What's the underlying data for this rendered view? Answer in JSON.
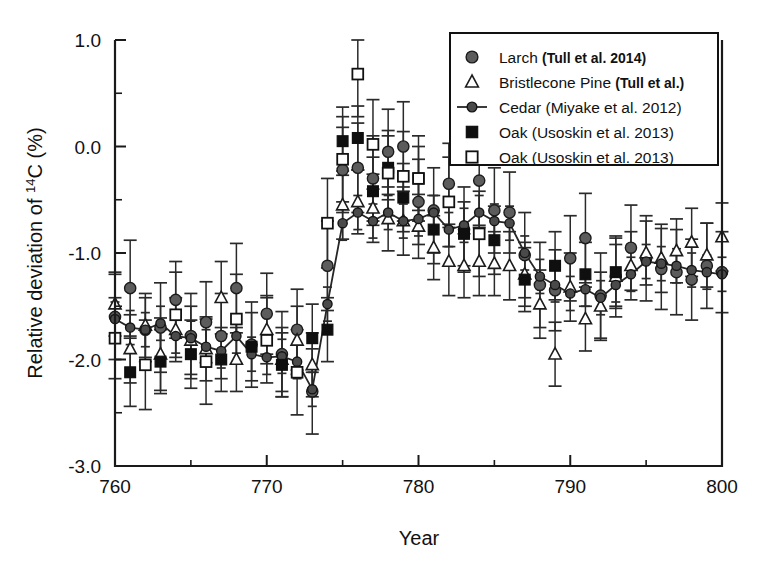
{
  "figure": {
    "name": "radiocarbon-relative-deviation-chart"
  },
  "axes": {
    "x_title": "Year",
    "y_title_prefix": "Relative deviation of ",
    "y_title_sup": "14",
    "y_title_suffix": "C (%)",
    "y_title_full": "Relative deviation of 14C (%)",
    "x_ticklabels": [
      "760",
      "770",
      "780",
      "790",
      "800"
    ],
    "y_ticklabels": [
      "1.0",
      "0.0",
      "-1.0",
      "-2.0",
      "-3.0"
    ]
  },
  "legend": {
    "entries": [
      {
        "marker": "filled-gray-circle",
        "name": "Larch",
        "ref": "(Tull et al. 2014)"
      },
      {
        "marker": "open-triangle",
        "name": "Bristlecone Pine",
        "ref": "(Tull et al.)"
      },
      {
        "marker": "line-with-circle",
        "name": "Cedar",
        "ref": "(Miyake et al. 2012)"
      },
      {
        "marker": "filled-black-square",
        "name": "Oak",
        "ref": "(Usoskin et al. 2013)"
      },
      {
        "marker": "open-square",
        "name": "Oak",
        "ref": "(Usoskin et al. 2013)"
      }
    ]
  },
  "chart_data": {
    "type": "scatter",
    "title": "",
    "xlabel": "Year",
    "ylabel": "Relative deviation of 14C (%)",
    "xlim": [
      760,
      800
    ],
    "ylim": [
      -3.0,
      1.0
    ],
    "xticks": [
      760,
      770,
      780,
      790,
      800
    ],
    "yticks": [
      1.0,
      0.0,
      -1.0,
      -2.0,
      -3.0
    ],
    "x_minor_ticks": [
      765,
      775,
      785,
      795
    ],
    "y_minor_ticks": [
      0.5,
      -0.5,
      -1.5,
      -2.5
    ],
    "grid": false,
    "legend_position": "top-right",
    "error_bars": "yerr",
    "series": [
      {
        "name": "Larch (Tull et al. 2014)",
        "marker": "filled-gray-circle",
        "color": "#5c5c5c",
        "x": [
          760,
          761,
          762,
          763,
          764,
          765,
          766,
          767,
          768,
          769,
          770,
          771,
          772,
          773,
          774,
          775,
          776,
          777,
          778,
          779,
          780,
          781,
          782,
          783,
          784,
          785,
          786,
          787,
          788,
          789,
          790,
          791,
          792,
          793,
          794,
          795,
          796,
          797,
          798,
          799,
          800
        ],
        "y": [
          -1.6,
          -1.33,
          -1.72,
          -1.7,
          -1.44,
          -1.78,
          -1.65,
          -1.78,
          -1.33,
          -1.86,
          -1.57,
          -1.95,
          -1.72,
          -2.3,
          -1.12,
          -0.22,
          -0.2,
          -0.3,
          -0.05,
          0.0,
          -0.52,
          -0.6,
          -0.35,
          -0.78,
          -0.32,
          -0.6,
          -0.62,
          -1.02,
          -1.3,
          -1.35,
          -1.05,
          -0.86,
          -1.4,
          -1.22,
          -0.95,
          -1.05,
          -1.15,
          -1.18,
          -1.25,
          -1.12,
          -1.18
        ],
        "yerr": [
          0.4,
          0.45,
          0.3,
          0.42,
          0.36,
          0.4,
          0.38,
          0.4,
          0.42,
          0.4,
          0.38,
          0.4,
          0.38,
          0.4,
          0.42,
          0.4,
          0.42,
          0.4,
          0.4,
          0.42,
          0.4,
          0.4,
          0.38,
          0.4,
          0.42,
          0.4,
          0.38,
          0.4,
          0.4,
          0.38,
          0.4,
          0.42,
          0.4,
          0.38,
          0.4,
          0.4,
          0.38,
          0.4,
          0.38,
          0.4,
          0.38
        ]
      },
      {
        "name": "Bristlecone Pine (Tull et al.)",
        "marker": "open-triangle",
        "color": "#ffffff",
        "x": [
          760,
          761,
          762,
          763,
          764,
          765,
          766,
          767,
          768,
          770,
          771,
          772,
          773,
          775,
          776,
          777,
          778,
          779,
          780,
          781,
          782,
          783,
          784,
          785,
          786,
          787,
          788,
          789,
          790,
          791,
          792,
          793,
          794,
          795,
          796,
          797,
          798,
          799,
          800
        ],
        "y": [
          -1.48,
          -1.9,
          -1.68,
          -1.95,
          -1.72,
          -1.82,
          -1.9,
          -1.42,
          -2.0,
          -1.72,
          -2.0,
          -1.82,
          -2.05,
          -0.55,
          -0.52,
          -0.58,
          -0.68,
          -0.7,
          -0.75,
          -0.95,
          -1.08,
          -1.12,
          -1.08,
          -1.1,
          -1.12,
          -1.2,
          -1.48,
          -1.95,
          -1.32,
          -1.62,
          -1.5,
          -1.22,
          -1.12,
          -1.0,
          -1.05,
          -0.98,
          -0.9,
          -1.02,
          -0.85
        ],
        "yerr": [
          0.3,
          0.32,
          0.3,
          0.34,
          0.3,
          0.32,
          0.3,
          0.34,
          0.3,
          0.32,
          0.3,
          0.32,
          0.3,
          0.32,
          0.3,
          0.32,
          0.3,
          0.32,
          0.3,
          0.3,
          0.32,
          0.3,
          0.32,
          0.3,
          0.32,
          0.3,
          0.32,
          0.3,
          0.32,
          0.3,
          0.32,
          0.3,
          0.32,
          0.3,
          0.32,
          0.3,
          0.32,
          0.3,
          0.32
        ]
      },
      {
        "name": "Cedar (Miyake et al. 2012)",
        "marker": "line-with-circle",
        "color": "#4a4a4a",
        "line": true,
        "x": [
          760,
          761,
          762,
          763,
          764,
          765,
          766,
          767,
          768,
          769,
          770,
          771,
          772,
          773,
          774,
          775,
          776,
          777,
          778,
          779,
          780,
          781,
          782,
          783,
          784,
          785,
          786,
          787,
          788,
          789,
          790,
          791,
          792,
          793,
          794,
          795,
          796,
          797,
          798,
          799,
          800
        ],
        "y": [
          -1.62,
          -1.7,
          -1.72,
          -1.66,
          -1.78,
          -1.8,
          -1.88,
          -1.92,
          -1.78,
          -1.95,
          -1.98,
          -1.97,
          -2.02,
          -2.28,
          -1.48,
          -0.72,
          -0.62,
          -0.7,
          -0.62,
          -0.7,
          -0.68,
          -0.62,
          -0.78,
          -0.74,
          -0.62,
          -0.7,
          -0.72,
          -1.0,
          -1.22,
          -1.3,
          -1.38,
          -1.34,
          -1.42,
          -1.3,
          -1.2,
          -1.08,
          -1.1,
          -1.12,
          -1.16,
          -1.18,
          -1.2
        ],
        "yerr": [
          0.16,
          0.16,
          0.16,
          0.16,
          0.16,
          0.16,
          0.16,
          0.16,
          0.16,
          0.16,
          0.16,
          0.16,
          0.16,
          0.16,
          0.16,
          0.16,
          0.16,
          0.16,
          0.16,
          0.16,
          0.16,
          0.16,
          0.16,
          0.16,
          0.16,
          0.16,
          0.16,
          0.16,
          0.16,
          0.16,
          0.16,
          0.16,
          0.16,
          0.16,
          0.16,
          0.16,
          0.16,
          0.16,
          0.16,
          0.16,
          0.16
        ]
      },
      {
        "name": "Oak filled (Usoskin et al. 2013)",
        "marker": "filled-black-square",
        "color": "#0f0f0f",
        "x": [
          761,
          763,
          765,
          767,
          769,
          771,
          773,
          774,
          775,
          776,
          777,
          778,
          779,
          780,
          781,
          783,
          785,
          787,
          789,
          791,
          793
        ],
        "y": [
          -2.12,
          -2.02,
          -1.95,
          -2.0,
          -1.88,
          -2.05,
          -1.8,
          -1.72,
          0.05,
          0.08,
          -0.42,
          -0.2,
          -0.48,
          -0.3,
          -0.78,
          -0.82,
          -0.88,
          -1.25,
          -1.12,
          -1.2,
          -1.18
        ],
        "yerr": [
          0.32,
          0.3,
          0.32,
          0.3,
          0.32,
          0.3,
          0.32,
          0.3,
          0.32,
          0.3,
          0.32,
          0.3,
          0.32,
          0.3,
          0.32,
          0.3,
          0.32,
          0.3,
          0.32,
          0.3,
          0.32
        ]
      },
      {
        "name": "Oak open (Usoskin et al. 2013)",
        "marker": "open-square",
        "color": "#ffffff",
        "x": [
          760,
          762,
          764,
          766,
          768,
          770,
          772,
          774,
          775,
          776,
          777,
          778,
          779,
          780,
          782,
          784
        ],
        "y": [
          -1.8,
          -2.05,
          -1.58,
          -2.02,
          -1.62,
          -1.82,
          -2.12,
          -0.72,
          -0.12,
          0.68,
          0.02,
          -0.25,
          -0.28,
          -0.3,
          -0.52,
          -0.82
        ],
        "yerr": [
          0.38,
          0.42,
          0.4,
          0.4,
          0.42,
          0.4,
          0.4,
          0.42,
          0.4,
          0.4,
          0.42,
          0.4,
          0.42,
          0.4,
          0.42,
          0.4
        ]
      }
    ]
  }
}
